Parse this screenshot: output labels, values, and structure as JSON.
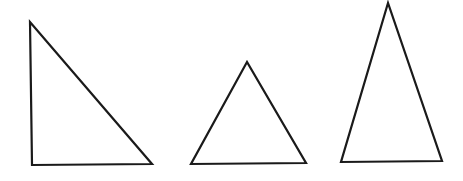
{
  "canvas": {
    "width": 463,
    "height": 181,
    "background": "#ffffff"
  },
  "stroke_color": "#1a1a1a",
  "shapes": [
    {
      "name": "right-triangle",
      "type": "triangle",
      "kind": "right",
      "points": "30,22 32,165 152,164"
    },
    {
      "name": "equilateral-triangle",
      "type": "triangle",
      "kind": "equilateral",
      "points": "247,62 191,164 306,163"
    },
    {
      "name": "isosceles-triangle",
      "type": "triangle",
      "kind": "isosceles",
      "points": "388,3 341,162 442,161"
    }
  ]
}
